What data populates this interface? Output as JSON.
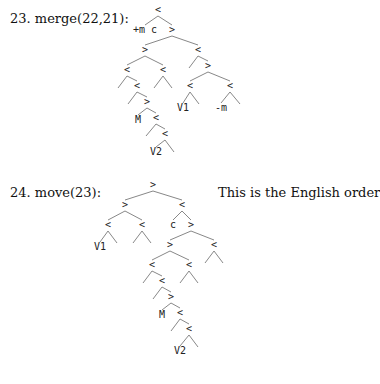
{
  "steps": [
    {
      "label": "23. merge(22,21):",
      "note": "",
      "tree": {
        "nodes": [
          {
            "id": "r",
            "t": "<",
            "x": 158,
            "y": 12
          },
          {
            "id": "a",
            "t": "+m c",
            "x": 145,
            "y": 32
          },
          {
            "id": "b",
            "t": ">",
            "x": 172,
            "y": 32
          },
          {
            "id": "c",
            "t": ">",
            "x": 145,
            "y": 52
          },
          {
            "id": "d",
            "t": "<",
            "x": 198,
            "y": 52
          },
          {
            "id": "e",
            "t": "<",
            "x": 127,
            "y": 72
          },
          {
            "id": "f",
            "t": "<",
            "x": 163,
            "y": 72
          },
          {
            "id": "e1",
            "t": "",
            "x": 118,
            "y": 88
          },
          {
            "id": "g",
            "t": "<",
            "x": 137,
            "y": 88
          },
          {
            "id": "f1",
            "t": "",
            "x": 154,
            "y": 88
          },
          {
            "id": "f2",
            "t": "",
            "x": 172,
            "y": 88
          },
          {
            "id": "g1",
            "t": "",
            "x": 128,
            "y": 104
          },
          {
            "id": "h",
            "t": ">",
            "x": 147,
            "y": 104
          },
          {
            "id": "M",
            "t": "M",
            "x": 138,
            "y": 122
          },
          {
            "id": "i",
            "t": "<",
            "x": 156,
            "y": 120
          },
          {
            "id": "i1",
            "t": "",
            "x": 146,
            "y": 136
          },
          {
            "id": "j",
            "t": "<",
            "x": 165,
            "y": 136
          },
          {
            "id": "V2",
            "t": "V2",
            "x": 156,
            "y": 154
          },
          {
            "id": "j1",
            "t": "",
            "x": 174,
            "y": 152
          },
          {
            "id": "d1",
            "t": "",
            "x": 189,
            "y": 68
          },
          {
            "id": "k",
            "t": ">",
            "x": 208,
            "y": 68
          },
          {
            "id": "l",
            "t": "<",
            "x": 190,
            "y": 88
          },
          {
            "id": "m",
            "t": "<",
            "x": 230,
            "y": 88
          },
          {
            "id": "V1",
            "t": "V1",
            "x": 183,
            "y": 110
          },
          {
            "id": "l1",
            "t": "",
            "x": 199,
            "y": 104
          },
          {
            "id": "mm",
            "t": "-m",
            "x": 221,
            "y": 110
          },
          {
            "id": "m1",
            "t": "",
            "x": 240,
            "y": 104
          }
        ],
        "edges": [
          [
            "r",
            "a"
          ],
          [
            "r",
            "b"
          ],
          [
            "b",
            "c"
          ],
          [
            "b",
            "d"
          ],
          [
            "c",
            "e"
          ],
          [
            "c",
            "f"
          ],
          [
            "e",
            "e1"
          ],
          [
            "e",
            "g"
          ],
          [
            "f",
            "f1"
          ],
          [
            "f",
            "f2"
          ],
          [
            "g",
            "g1"
          ],
          [
            "g",
            "h"
          ],
          [
            "h",
            "M"
          ],
          [
            "h",
            "i"
          ],
          [
            "i",
            "i1"
          ],
          [
            "i",
            "j"
          ],
          [
            "j",
            "V2"
          ],
          [
            "j",
            "j1"
          ],
          [
            "d",
            "d1"
          ],
          [
            "d",
            "k"
          ],
          [
            "k",
            "l"
          ],
          [
            "k",
            "m"
          ],
          [
            "l",
            "V1"
          ],
          [
            "l",
            "l1"
          ],
          [
            "m",
            "mm"
          ],
          [
            "m",
            "m1"
          ]
        ]
      }
    },
    {
      "label": "24. move(23):",
      "note": "This is the English order",
      "tree": {
        "nodes": [
          {
            "id": "r",
            "t": ">",
            "x": 153,
            "y": 187
          },
          {
            "id": "a",
            "t": ">",
            "x": 125,
            "y": 207
          },
          {
            "id": "b",
            "t": "<",
            "x": 182,
            "y": 207
          },
          {
            "id": "c",
            "t": "<",
            "x": 108,
            "y": 227
          },
          {
            "id": "d",
            "t": "<",
            "x": 142,
            "y": 227
          },
          {
            "id": "V1",
            "t": "V1",
            "x": 100,
            "y": 249
          },
          {
            "id": "c1",
            "t": "",
            "x": 117,
            "y": 243
          },
          {
            "id": "d1",
            "t": "",
            "x": 133,
            "y": 243
          },
          {
            "id": "d2",
            "t": "",
            "x": 151,
            "y": 243
          },
          {
            "id": "cc",
            "t": "c",
            "x": 173,
            "y": 227
          },
          {
            "id": "e",
            "t": ">",
            "x": 191,
            "y": 227
          },
          {
            "id": "f",
            "t": ">",
            "x": 170,
            "y": 247
          },
          {
            "id": "g",
            "t": "<",
            "x": 214,
            "y": 247
          },
          {
            "id": "g1",
            "t": "",
            "x": 205,
            "y": 263
          },
          {
            "id": "g2",
            "t": "",
            "x": 223,
            "y": 263
          },
          {
            "id": "h",
            "t": "<",
            "x": 152,
            "y": 267
          },
          {
            "id": "i",
            "t": "<",
            "x": 189,
            "y": 267
          },
          {
            "id": "i1",
            "t": "",
            "x": 180,
            "y": 283
          },
          {
            "id": "i2",
            "t": "",
            "x": 198,
            "y": 283
          },
          {
            "id": "h1",
            "t": "",
            "x": 143,
            "y": 283
          },
          {
            "id": "j",
            "t": "<",
            "x": 162,
            "y": 283
          },
          {
            "id": "j1",
            "t": "",
            "x": 153,
            "y": 299
          },
          {
            "id": "k",
            "t": ">",
            "x": 171,
            "y": 299
          },
          {
            "id": "M",
            "t": "M",
            "x": 162,
            "y": 317
          },
          {
            "id": "l",
            "t": "<",
            "x": 180,
            "y": 315
          },
          {
            "id": "l1",
            "t": "",
            "x": 171,
            "y": 331
          },
          {
            "id": "n",
            "t": "<",
            "x": 189,
            "y": 331
          },
          {
            "id": "V2",
            "t": "V2",
            "x": 180,
            "y": 353
          },
          {
            "id": "n1",
            "t": "",
            "x": 198,
            "y": 347
          }
        ],
        "edges": [
          [
            "r",
            "a"
          ],
          [
            "r",
            "b"
          ],
          [
            "a",
            "c"
          ],
          [
            "a",
            "d"
          ],
          [
            "c",
            "V1"
          ],
          [
            "c",
            "c1"
          ],
          [
            "d",
            "d1"
          ],
          [
            "d",
            "d2"
          ],
          [
            "b",
            "cc"
          ],
          [
            "b",
            "e"
          ],
          [
            "e",
            "f"
          ],
          [
            "e",
            "g"
          ],
          [
            "g",
            "g1"
          ],
          [
            "g",
            "g2"
          ],
          [
            "f",
            "h"
          ],
          [
            "f",
            "i"
          ],
          [
            "i",
            "i1"
          ],
          [
            "i",
            "i2"
          ],
          [
            "h",
            "h1"
          ],
          [
            "h",
            "j"
          ],
          [
            "j",
            "j1"
          ],
          [
            "j",
            "k"
          ],
          [
            "k",
            "M"
          ],
          [
            "k",
            "l"
          ],
          [
            "l",
            "l1"
          ],
          [
            "l",
            "n"
          ],
          [
            "n",
            "V2"
          ],
          [
            "n",
            "n1"
          ]
        ]
      }
    }
  ]
}
